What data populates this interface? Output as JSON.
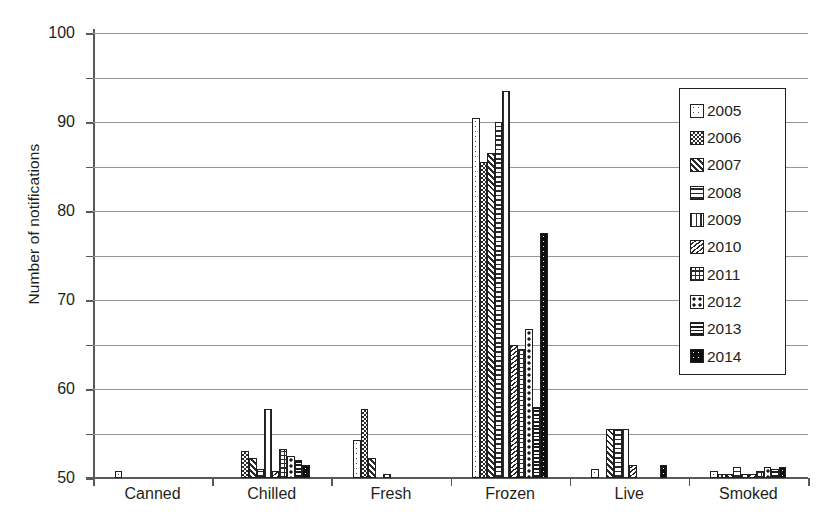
{
  "chart_data": {
    "type": "bar",
    "title": "",
    "xlabel": "",
    "ylabel": "Number of notifications",
    "ylim": [
      0,
      100
    ],
    "ytick_step": 10,
    "yticks": [
      "0",
      "10",
      "20",
      "30",
      "40",
      "50",
      "60",
      "70",
      "80",
      "90",
      "100"
    ],
    "grid": "horizontal",
    "legend_position": "right-inside",
    "categories": [
      "Canned",
      "Chilled",
      "Fresh",
      "Frozen",
      "Live",
      "Smoked"
    ],
    "series": [
      {
        "name": "2005",
        "pattern": "sparse-dots-white",
        "values": [
          1.5,
          0,
          8.5,
          81,
          2,
          1.5
        ]
      },
      {
        "name": "2006",
        "pattern": "dense-checkerboard",
        "values": [
          0,
          6,
          15.5,
          71,
          0,
          1
        ]
      },
      {
        "name": "2007",
        "pattern": "diagonal-lines",
        "values": [
          0,
          4.5,
          4.5,
          73,
          11,
          1
        ]
      },
      {
        "name": "2008",
        "pattern": "horizontal-lines",
        "values": [
          0,
          2,
          0,
          80,
          11,
          2.5
        ]
      },
      {
        "name": "2009",
        "pattern": "vertical-lines",
        "values": [
          0,
          15.5,
          1,
          87,
          11,
          1
        ]
      },
      {
        "name": "2010",
        "pattern": "wave-crosshatch",
        "values": [
          0,
          1.5,
          0,
          30,
          3,
          1
        ]
      },
      {
        "name": "2011",
        "pattern": "grid",
        "values": [
          0,
          6.5,
          0,
          29,
          0,
          1.5
        ]
      },
      {
        "name": "2012",
        "pattern": "large-dots",
        "values": [
          0,
          5,
          0,
          33.5,
          0,
          2.5
        ]
      },
      {
        "name": "2013",
        "pattern": "dense-horizontal-lines",
        "values": [
          0,
          4,
          0,
          16,
          0,
          2
        ]
      },
      {
        "name": "2014",
        "pattern": "black-dots",
        "values": [
          0,
          3,
          0,
          55,
          3,
          2.5
        ]
      }
    ]
  },
  "legend": {
    "items": [
      {
        "label": "2005"
      },
      {
        "label": "2006"
      },
      {
        "label": "2007"
      },
      {
        "label": "2008"
      },
      {
        "label": "2009"
      },
      {
        "label": "2010"
      },
      {
        "label": "2011"
      },
      {
        "label": "2012"
      },
      {
        "label": "2013"
      },
      {
        "label": "2014"
      }
    ]
  },
  "colors": {
    "axis": "#58595b",
    "gridline": "#939598",
    "text": "#231f20",
    "bar_outline": "#231f20",
    "background": "#ffffff"
  }
}
